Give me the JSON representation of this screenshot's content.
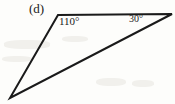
{
  "figure": {
    "part_label": "(d)",
    "background_color": "#fdfdfb",
    "stroke_color": "#1a1a1a",
    "stroke_width": 2,
    "width": 175,
    "height": 104
  },
  "shape": {
    "type": "triangle",
    "name": "obtuse-scalene-triangle",
    "vertices": [
      {
        "name": "top-left-vertex",
        "x": 58,
        "y": 15
      },
      {
        "name": "right-vertex",
        "x": 172,
        "y": 14
      },
      {
        "name": "bottom-left-vertex",
        "x": 10,
        "y": 98
      }
    ],
    "edges": [
      {
        "name": "top-edge",
        "from": "top-left-vertex",
        "to": "right-vertex"
      },
      {
        "name": "right-diagonal-edge",
        "from": "right-vertex",
        "to": "bottom-left-vertex"
      },
      {
        "name": "left-edge",
        "from": "bottom-left-vertex",
        "to": "top-left-vertex"
      }
    ]
  },
  "angles": {
    "left": {
      "value": "110",
      "degree_symbol": "°",
      "label": "110°",
      "at_vertex": "top-left-vertex"
    },
    "right": {
      "value": "30",
      "degree_symbol": "°",
      "label": "30°",
      "at_vertex": "right-vertex"
    }
  },
  "chart_data": {
    "type": "diagram",
    "title": "(d)",
    "annotations": [
      "110°",
      "30°"
    ]
  }
}
